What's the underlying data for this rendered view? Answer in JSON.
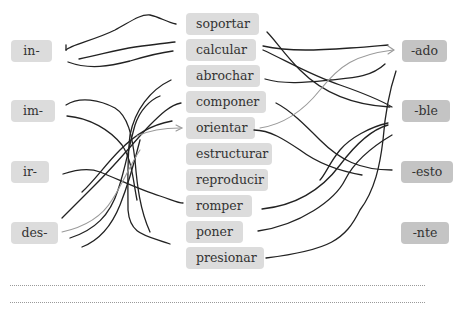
{
  "exercise": {
    "prefixes": [
      {
        "label": "in-"
      },
      {
        "label": "im-"
      },
      {
        "label": "ir-"
      },
      {
        "label": "des-"
      }
    ],
    "verbs": [
      {
        "label": "soportar"
      },
      {
        "label": "calcular"
      },
      {
        "label": "abrochar"
      },
      {
        "label": "componer"
      },
      {
        "label": "orientar"
      },
      {
        "label": "estructurar"
      },
      {
        "label": "reproducir"
      },
      {
        "label": "romper"
      },
      {
        "label": "poner"
      },
      {
        "label": "presionar"
      }
    ],
    "suffixes": [
      {
        "label": "-ado"
      },
      {
        "label": "-ble"
      },
      {
        "label": "-esto"
      },
      {
        "label": "-nte"
      }
    ],
    "answer_lines": 2,
    "colors": {
      "box_light": "#dcdcdc",
      "box_dark": "#c4c4c4",
      "stroke": "#222222",
      "stroke_light": "#999999"
    }
  }
}
